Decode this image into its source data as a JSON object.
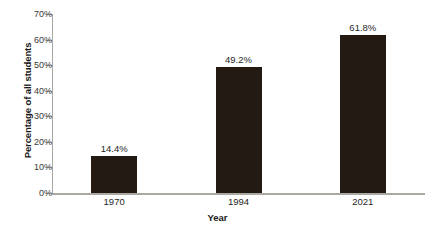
{
  "chart_data": {
    "type": "bar",
    "title": "",
    "categories": [
      "1970",
      "1994",
      "2021"
    ],
    "values": [
      14.4,
      49.2,
      61.8
    ],
    "value_labels": [
      "14.4%",
      "49.2%",
      "61.8%"
    ],
    "series": [
      {
        "name": "Percentage of all students",
        "values": [
          14.4,
          49.2,
          61.8
        ]
      }
    ],
    "xlabel": "Year",
    "ylabel": "Percentage of all students",
    "ylim": [
      0,
      70
    ],
    "ytick_values": [
      0,
      10,
      20,
      30,
      40,
      50,
      60,
      70
    ],
    "ytick_labels": [
      "0%",
      "10%",
      "20%",
      "30%",
      "40%",
      "50%",
      "60%",
      "70%"
    ],
    "grid": false,
    "legend": false,
    "legend_position": "none",
    "bar_color": "#231a14",
    "axis_color": "#a9a9a1",
    "text_color": "#262626"
  }
}
